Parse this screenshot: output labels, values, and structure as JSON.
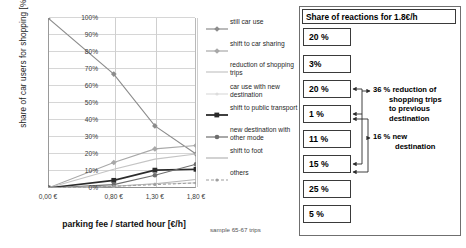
{
  "chart_data": {
    "type": "line",
    "title": "",
    "xlabel": "parking fee / started hour [€/h]",
    "ylabel": "share of car users for shopping [%]",
    "categories": [
      "0,00 €",
      "0,80 €",
      "1,30 €",
      "1,80 €"
    ],
    "x": [
      0.0,
      0.8,
      1.3,
      1.8
    ],
    "ylim": [
      0,
      100
    ],
    "yticks": [
      "0%",
      "10%",
      "20%",
      "30%",
      "40%",
      "50%",
      "60%",
      "70%",
      "80%",
      "90%",
      "100%"
    ],
    "grid": true,
    "legend_position": "right",
    "annotation": "sample 65-67 trips",
    "series": [
      {
        "name": "still car use",
        "values": [
          100,
          67,
          36.5,
          20
        ],
        "color": "#8c8c8c",
        "marker": "diamond"
      },
      {
        "name": "shift to car sharing",
        "values": [
          0,
          15,
          23,
          25
        ],
        "color": "#a8a8a8",
        "marker": "diamond"
      },
      {
        "name": "reduction of shopping trips",
        "values": [
          0,
          11,
          17,
          20
        ],
        "color": "#c4c4c4",
        "marker": "none"
      },
      {
        "name": "car use with new destination",
        "values": [
          0,
          1,
          2.5,
          3
        ],
        "color": "#dcdcdc",
        "marker": "dot"
      },
      {
        "name": "shift to public transport",
        "values": [
          0,
          4.5,
          10.5,
          11
        ],
        "color": "#2b2b2b",
        "marker": "square"
      },
      {
        "name": "new destination with other mode",
        "values": [
          0,
          2,
          7.5,
          14
        ],
        "color": "#6e6e6e",
        "marker": "circle"
      },
      {
        "name": "shift to foot",
        "values": [
          0,
          1,
          2.5,
          5
        ],
        "color": "#b5b5b5",
        "marker": "none"
      },
      {
        "name": "others",
        "values": [
          0,
          1,
          2,
          3
        ],
        "color": "#9e9e9e",
        "marker": "dash"
      }
    ]
  },
  "legend": {
    "items": [
      {
        "label": "still car use"
      },
      {
        "label": "shift to car sharing"
      },
      {
        "label": "reduction of shopping trips"
      },
      {
        "label": "car use with new destination"
      },
      {
        "label": "shift to public transport"
      },
      {
        "label": "new destination with other mode"
      },
      {
        "label": "shift to foot"
      },
      {
        "label": "others"
      }
    ]
  },
  "panel": {
    "title": "Share of reactions for 1.8€/h",
    "boxes": [
      {
        "value": "20 %"
      },
      {
        "value": "3%"
      },
      {
        "value": "20 %"
      },
      {
        "value": "1 %"
      },
      {
        "value": "11 %"
      },
      {
        "value": "15 %"
      },
      {
        "value": "25 %"
      },
      {
        "value": "5 %"
      }
    ],
    "notes": [
      {
        "text": "36 % reduction of shopping trips to previous destination"
      },
      {
        "text": "16 % new destination"
      }
    ]
  }
}
